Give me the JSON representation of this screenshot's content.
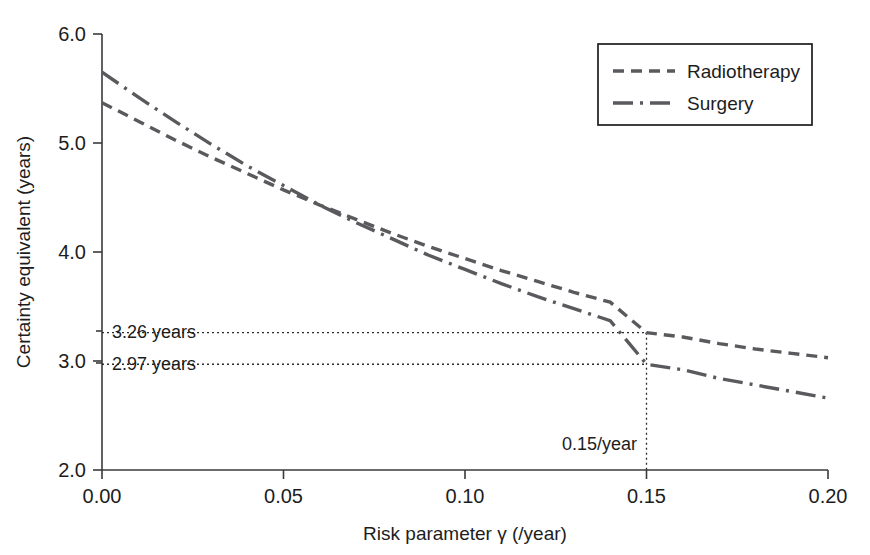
{
  "chart_data": {
    "type": "line",
    "title": "",
    "xlabel": "Risk parameter γ (/year)",
    "ylabel": "Certainty equivalent (years)",
    "xlim": [
      0.0,
      0.2
    ],
    "ylim": [
      2.0,
      6.0
    ],
    "xticks": [
      "0.00",
      "0.05",
      "0.10",
      "0.15",
      "0.20"
    ],
    "xtick_values": [
      0.0,
      0.05,
      0.1,
      0.15,
      0.2
    ],
    "yticks": [
      "2.0",
      "3.0",
      "4.0",
      "5.0",
      "6.0"
    ],
    "ytick_values": [
      2.0,
      3.0,
      4.0,
      5.0,
      6.0
    ],
    "grid": false,
    "legend_position": "top-right",
    "x": [
      0.0,
      0.01,
      0.02,
      0.03,
      0.04,
      0.05,
      0.06,
      0.07,
      0.08,
      0.09,
      0.1,
      0.11,
      0.12,
      0.13,
      0.14,
      0.15,
      0.16,
      0.17,
      0.18,
      0.19,
      0.2
    ],
    "series": [
      {
        "name": "Radiotherapy",
        "dash": "dashed",
        "color": "#5a5a5e",
        "values": [
          5.37,
          5.2,
          5.03,
          4.87,
          4.72,
          4.57,
          4.43,
          4.3,
          4.17,
          4.05,
          3.94,
          3.83,
          3.73,
          3.63,
          3.54,
          3.26,
          3.22,
          3.16,
          3.11,
          3.07,
          3.03
        ]
      },
      {
        "name": "Surgery",
        "dash": "dash-dot",
        "color": "#5a5a5e",
        "values": [
          5.65,
          5.42,
          5.2,
          4.99,
          4.79,
          4.61,
          4.43,
          4.27,
          4.12,
          3.97,
          3.84,
          3.71,
          3.59,
          3.48,
          3.37,
          2.97,
          2.92,
          2.84,
          2.78,
          2.72,
          2.66
        ]
      }
    ],
    "annotations": [
      {
        "id": "radiotherapy-ce",
        "label": "3.26 years",
        "x": 0.15,
        "y": 3.26
      },
      {
        "id": "surgery-ce",
        "label": "2.97 years",
        "x": 0.15,
        "y": 2.97
      },
      {
        "id": "gamma-marker",
        "label": "0.15/year",
        "x": 0.15
      }
    ]
  },
  "axes": {
    "x_title": "Risk parameter γ (/year)",
    "y_title": "Certainty equivalent (years)",
    "x_tick_labels": [
      "0.00",
      "0.05",
      "0.10",
      "0.15",
      "0.20"
    ],
    "y_tick_labels": [
      "2.0",
      "3.0",
      "4.0",
      "5.0",
      "6.0"
    ]
  },
  "legend": {
    "entries": [
      {
        "label": "Radiotherapy",
        "style": "dashed"
      },
      {
        "label": "Surgery",
        "style": "dash-dot"
      }
    ]
  },
  "annotations": {
    "radiotherapy_value": "3.26 years",
    "surgery_value": "2.97 years",
    "gamma_value": "0.15/year"
  },
  "colors": {
    "line": "#5a5a5e",
    "axis": "#3a3a3a",
    "text": "#1d1d1d",
    "background": "#ffffff"
  }
}
